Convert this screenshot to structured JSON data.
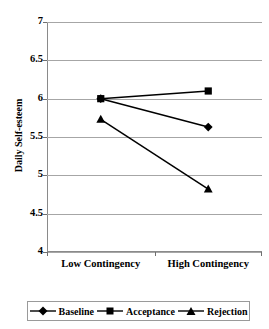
{
  "chart_data": {
    "type": "line",
    "title": "",
    "xlabel": "",
    "ylabel": "Daily Self-esteem",
    "categories": [
      "Low Contingency",
      "High Contingency"
    ],
    "ylim": [
      4,
      7
    ],
    "ytick_labels": [
      "7",
      "6.5",
      "6",
      "5.5",
      "5",
      "4.5",
      "4"
    ],
    "ytick_values": [
      7,
      6.5,
      6,
      5.5,
      5,
      4.5,
      4
    ],
    "grid": true,
    "legend_position": "bottom",
    "series": [
      {
        "name": "Baseline",
        "marker": "diamond",
        "values": [
          6.0,
          5.63
        ]
      },
      {
        "name": "Acceptance",
        "marker": "square",
        "values": [
          6.0,
          6.1
        ]
      },
      {
        "name": "Rejection",
        "marker": "triangle",
        "values": [
          5.73,
          4.82
        ]
      }
    ],
    "colors": {
      "line": "#000000",
      "marker": "#000000",
      "grid": "#a6a6a6",
      "axis": "#8a8a8a",
      "background": "#ffffff"
    }
  }
}
